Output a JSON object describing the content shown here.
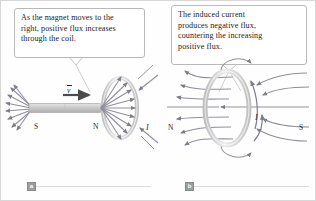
{
  "figure": {
    "panels": [
      {
        "id": "a",
        "badge": "a",
        "caption_lines": [
          "As the magnet moves to the",
          "right, positive flux increases",
          "through the coil."
        ],
        "labels": {
          "south_pole": "S",
          "north_pole": "N",
          "velocity": "v",
          "current": "I"
        }
      },
      {
        "id": "b",
        "badge": "b",
        "caption_lines": [
          "The induced current",
          "produces negative flux,",
          "countering the increasing",
          "positive flux."
        ],
        "labels": {
          "north_pole": "N",
          "south_pole": "S",
          "current": "I"
        }
      }
    ],
    "colors": {
      "frame": "#d8d8d8",
      "bubble_border": "#b9b9b9",
      "field_line": "#8f8f9c",
      "magnet_body": "#cfcfcf",
      "coil": "#d6d6d6",
      "badge": "#9d9d9d",
      "text": "#1b1b1b"
    }
  }
}
